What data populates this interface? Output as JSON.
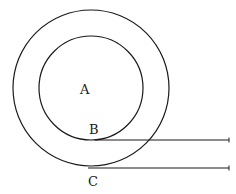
{
  "diagram": {
    "type": "geometry",
    "colors": {
      "stroke": "#1a1a1a",
      "background": "#ffffff"
    },
    "outer_circle": {
      "cx": 91,
      "cy": 88,
      "r": 78
    },
    "inner_circle": {
      "cx": 91,
      "cy": 88,
      "r": 52
    },
    "lines": [
      {
        "id": "B-line",
        "x1": 97,
        "y1": 140,
        "x2": 229,
        "y2": 140
      },
      {
        "id": "C-line",
        "x1": 88,
        "y1": 168,
        "x2": 229,
        "y2": 168
      }
    ],
    "labels": {
      "center": "A",
      "inner_point": "B",
      "outer_point": "C"
    }
  }
}
